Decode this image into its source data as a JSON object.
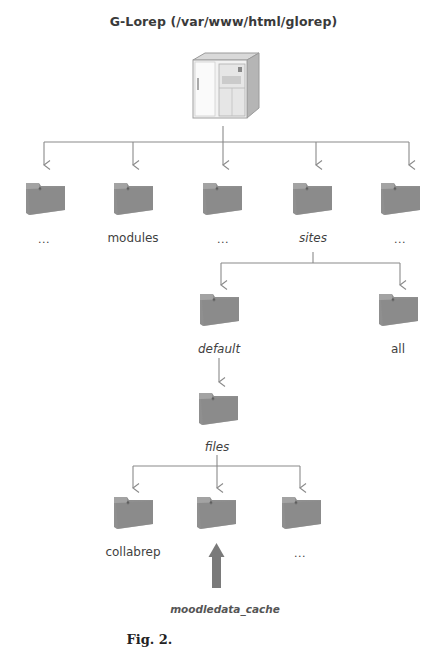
{
  "title": "G-Lorep (/var/www/html/glorep)",
  "root": {
    "icon": "server-tower-icon",
    "label": "G-Lorep (/var/www/html/glorep)"
  },
  "level1": [
    {
      "label": "...",
      "italic": false,
      "icon": "folder-icon"
    },
    {
      "label": "modules",
      "italic": false,
      "icon": "folder-icon"
    },
    {
      "label": "...",
      "italic": false,
      "icon": "folder-icon"
    },
    {
      "label": "sites",
      "italic": true,
      "icon": "folder-icon"
    },
    {
      "label": "...",
      "italic": false,
      "icon": "folder-icon"
    }
  ],
  "level2": [
    {
      "label": "default",
      "italic": true,
      "icon": "folder-icon"
    },
    {
      "label": "all",
      "italic": false,
      "icon": "folder-icon"
    }
  ],
  "level3": [
    {
      "label": "files",
      "italic": true,
      "icon": "folder-icon"
    }
  ],
  "level4": [
    {
      "label": "collabrep",
      "italic": false,
      "icon": "folder-icon"
    },
    {
      "label": "",
      "italic": false,
      "icon": "folder-icon"
    },
    {
      "label": "...",
      "italic": false,
      "icon": "folder-icon"
    }
  ],
  "pointer": {
    "icon": "up-arrow-icon",
    "label": "moodledata_cache",
    "color": "#7a7a7a"
  },
  "caption": {
    "prefix": "Fig. 2.",
    "text": "... collabrep ... folder (cut off)"
  },
  "colors": {
    "connector": "#8a8a8a",
    "folder": "#8c8c8c",
    "folder_dark": "#6f6f6f",
    "text": "#3a3a3a"
  }
}
